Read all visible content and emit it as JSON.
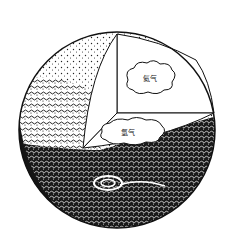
{
  "diagram": {
    "background": "#ffffff",
    "ink_color": "#111111",
    "labels": {
      "upper_cloud": "氦气",
      "lower_cloud": "氢气"
    }
  }
}
